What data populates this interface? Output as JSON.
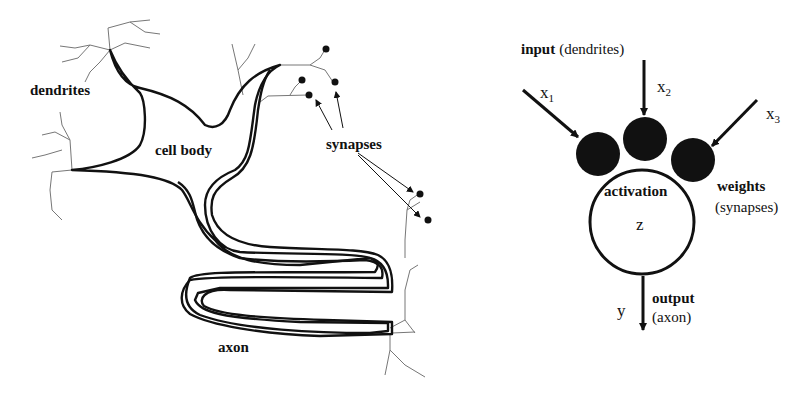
{
  "biological_neuron": {
    "labels": {
      "dendrites": "dendrites",
      "cell_body": "cell body",
      "synapses": "synapses",
      "axon": "axon"
    }
  },
  "artificial_neuron": {
    "input_bold": "input",
    "input_paren": "(dendrites)",
    "inputs": [
      {
        "var": "x",
        "sub": "1"
      },
      {
        "var": "x",
        "sub": "2"
      },
      {
        "var": "x",
        "sub": "3"
      }
    ],
    "activation": "activation",
    "activation_var": "z",
    "weights_bold": "weights",
    "weights_paren": "(synapses)",
    "output_var": "y",
    "output_bold": "output",
    "output_paren": "(axon)"
  },
  "colors": {
    "ink": "#111111",
    "dendrite": "#777777",
    "background": "#ffffff"
  }
}
